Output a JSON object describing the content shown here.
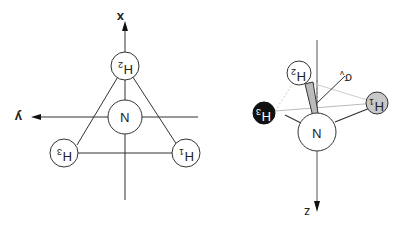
{
  "diagram": {
    "orientation": "rotated-180",
    "left_view": {
      "title": "top view (x-y plane)",
      "axes": {
        "x_label": "x",
        "y_label": "y"
      },
      "atoms": {
        "center": {
          "label": "N"
        },
        "h1": {
          "label": "H",
          "sub": "1"
        },
        "h2": {
          "label": "H",
          "sub": "2"
        },
        "h3": {
          "label": "H",
          "sub": "3"
        }
      }
    },
    "right_view": {
      "title": "side view (3D)",
      "axes": {
        "z_label": "z",
        "sigma_label": "σ",
        "sigma_sub": "v"
      },
      "atoms": {
        "center": {
          "label": "N"
        },
        "h1": {
          "label": "H",
          "sub": "1",
          "fill": "#c8c8c8"
        },
        "h2": {
          "label": "H",
          "sub": "2",
          "fill": "#ffffff"
        },
        "h3": {
          "label": "H",
          "sub": "3",
          "fill": "#111111"
        }
      }
    }
  }
}
